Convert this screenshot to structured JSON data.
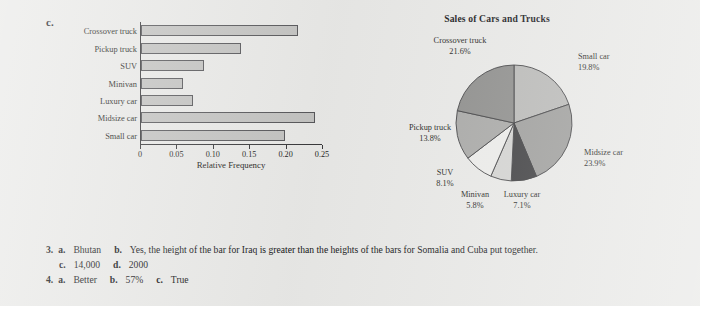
{
  "page": {
    "background_color": "#e9e9e7",
    "panel_c_letter": "c.",
    "panel_d_letter": "d."
  },
  "chart_data": [
    {
      "type": "bar",
      "orientation": "horizontal",
      "panel": "c.",
      "title": "",
      "xlabel": "Relative Frequency",
      "ylabel": "",
      "xlim": [
        0,
        0.25
      ],
      "xticks": [
        "0",
        "0.05",
        "0.10",
        "0.15",
        "0.20",
        "0.25"
      ],
      "xtick_values": [
        0,
        0.05,
        0.1,
        0.15,
        0.2,
        0.25
      ],
      "grid": false,
      "bar_fill": "#c3c3c1",
      "bar_stroke": "#57575a",
      "categories": [
        "Crossover truck",
        "Pickup truck",
        "SUV",
        "Minivan",
        "Luxury car",
        "Midsize car",
        "Small car"
      ],
      "values": [
        0.216,
        0.138,
        0.087,
        0.058,
        0.071,
        0.239,
        0.198
      ]
    },
    {
      "type": "pie",
      "panel": "d.",
      "title": "Sales of Cars and Trucks",
      "legend_position": "outside-labels",
      "start_angle_deg": 0,
      "labels": [
        "Small car",
        "Midsize car",
        "Luxury car",
        "Minivan",
        "SUV",
        "Pickup truck",
        "Crossover truck"
      ],
      "values": [
        19.8,
        23.9,
        7.1,
        5.8,
        8.1,
        13.8,
        21.6
      ],
      "value_texts": [
        "19.8%",
        "23.9%",
        "7.1%",
        "5.8%",
        "8.1%",
        "13.8%",
        "21.6%"
      ],
      "slice_colors": [
        "#b9b9b7",
        "#9d9d9b",
        "#3c3c3e",
        "#d3d3d1",
        "#ececea",
        "#a8a8a6",
        "#8d8d8b"
      ],
      "slice_stroke": "#3a3a3c"
    }
  ],
  "answers": {
    "line1": {
      "number": "3.",
      "a_marker": "a.",
      "a_text": "Bhutan",
      "b_marker": "b.",
      "b_text": "Yes, the height of the bar for Iraq is greater than the heights of the bars for Somalia and Cuba put together."
    },
    "line2": {
      "c_marker": "c.",
      "c_text": "14,000",
      "d_marker": "d.",
      "d_text": "2000"
    },
    "line3": {
      "number": "4.",
      "a_marker": "a.",
      "a_text": "Better",
      "b_marker": "b.",
      "b_text": "57%",
      "c_marker": "c.",
      "c_text": "True"
    }
  }
}
